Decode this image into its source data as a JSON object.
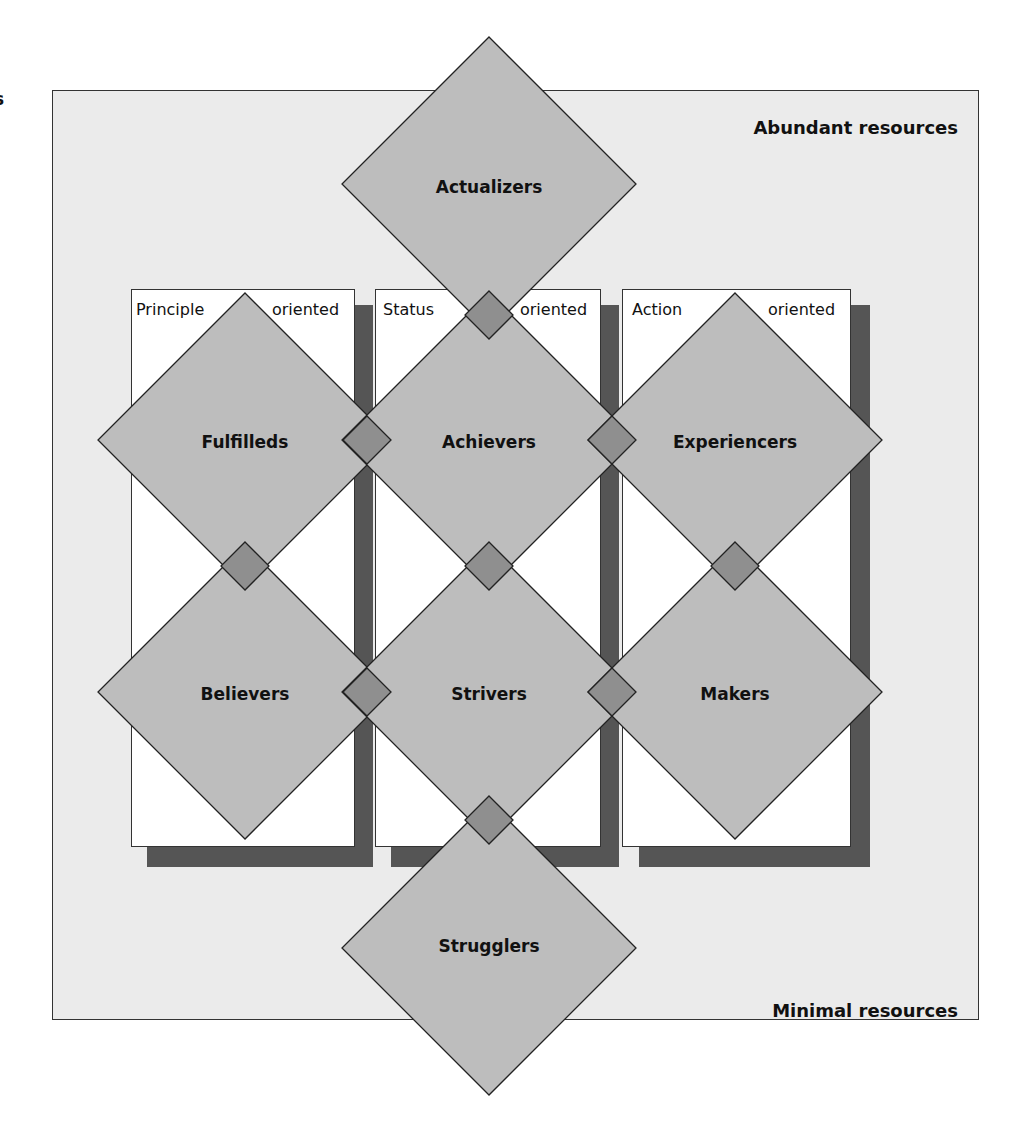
{
  "stray_text": "s",
  "axis": {
    "top_label": "Abundant resources",
    "bottom_label": "Minimal resources"
  },
  "columns": [
    {
      "left_word": "Principle",
      "right_word": "oriented"
    },
    {
      "left_word": "Status",
      "right_word": "oriented"
    },
    {
      "left_word": "Action",
      "right_word": "oriented"
    }
  ],
  "segments": [
    {
      "name": "Actualizers",
      "cx": 489,
      "cy": 184
    },
    {
      "name": "Fulfilleds",
      "cx": 245,
      "cy": 440
    },
    {
      "name": "Achievers",
      "cx": 489,
      "cy": 440
    },
    {
      "name": "Experiencers",
      "cx": 735,
      "cy": 440
    },
    {
      "name": "Believers",
      "cx": 245,
      "cy": 692
    },
    {
      "name": "Strivers",
      "cx": 489,
      "cy": 692
    },
    {
      "name": "Makers",
      "cx": 735,
      "cy": 692
    },
    {
      "name": "Strugglers",
      "cx": 489,
      "cy": 948
    }
  ],
  "colors": {
    "frame_bg": "#ebebeb",
    "diamond_fill": "#bdbdbd",
    "overlap_fill": "#8f8f8f",
    "shadow": "#555555",
    "stroke": "#222222"
  }
}
